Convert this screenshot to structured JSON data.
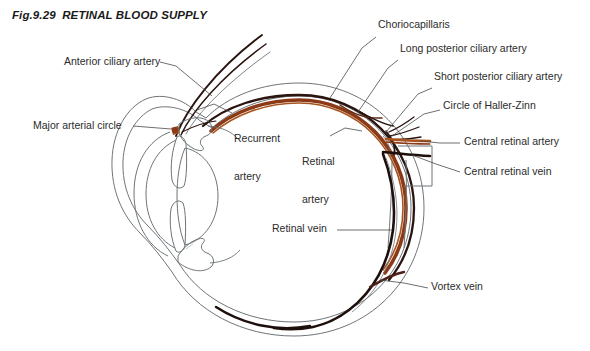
{
  "figure": {
    "number": "Fig.9.29",
    "title": "RETINAL BLOOD SUPPLY",
    "full_title": "Fig.9.29  RETINAL BLOOD SUPPLY"
  },
  "colors": {
    "background": "#ffffff",
    "text": "#2b2b2b",
    "title_text": "#1a1a1a",
    "outline": "#6e7478",
    "choroid_rust": "#8b3a18",
    "choroid_light": "#a8541f",
    "vessel_dark": "#2a1410",
    "vein_dark": "#1d0f0c",
    "leader_line": "#4a4a4a"
  },
  "labels": {
    "anterior_ciliary_artery": "Anterior ciliary artery",
    "major_arterial_circle": "Major arterial circle",
    "recurrent_artery_line1": "Recurrent",
    "recurrent_artery_line2": "artery",
    "retinal_artery_line1": "Retinal",
    "retinal_artery_line2": "artery",
    "choriocapillaris": "Choriocapillaris",
    "long_posterior_ciliary_artery": "Long posterior ciliary artery",
    "short_posterior_ciliary_artery": "Short posterior ciliary artery",
    "circle_of_haller_zinn": "Circle of Haller-Zinn",
    "central_retinal_artery": "Central retinal artery",
    "central_retinal_vein": "Central retinal vein",
    "retinal_vein": "Retinal vein",
    "vortex_vein": "Vortex vein"
  },
  "structures": [
    "sclera",
    "choroid",
    "retina",
    "cornea",
    "iris",
    "lens",
    "ciliary-body",
    "optic-nerve"
  ]
}
